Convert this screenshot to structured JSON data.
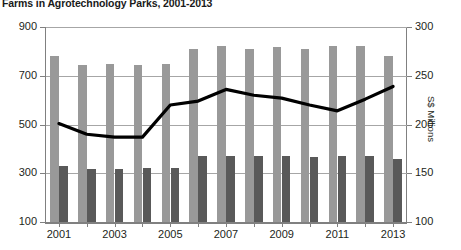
{
  "chart_data": {
    "type": "bar",
    "title": "Farms in Agrotechnology Parks, 2001-2013",
    "xlabel": "",
    "ylabel": "",
    "ylabel_right": "S$ Millions",
    "categories": [
      "2001",
      "2002",
      "2003",
      "2004",
      "2005",
      "2006",
      "2007",
      "2008",
      "2009",
      "2010",
      "2011",
      "2012",
      "2013"
    ],
    "xtick_labels": [
      "2001",
      "",
      "2003",
      "",
      "2005",
      "",
      "2007",
      "",
      "2009",
      "",
      "2011",
      "",
      "2013"
    ],
    "ylim": [
      100,
      900
    ],
    "yticks": [
      100,
      300,
      500,
      700,
      900
    ],
    "ylim_right": [
      100,
      300
    ],
    "yticks_right": [
      100,
      150,
      200,
      250,
      300
    ],
    "grid": true,
    "legend": "none",
    "series": [
      {
        "name": "Farms (light bar)",
        "type": "bar",
        "color": "#999999",
        "axis": "left",
        "values": [
          782,
          745,
          748,
          745,
          748,
          808,
          822,
          808,
          820,
          808,
          822,
          822,
          782
        ]
      },
      {
        "name": "Farms (dark bar)",
        "type": "bar",
        "color": "#595959",
        "axis": "left",
        "values": [
          330,
          318,
          318,
          322,
          322,
          372,
          372,
          372,
          372,
          368,
          372,
          372,
          358
        ]
      },
      {
        "name": "Output value",
        "type": "line",
        "color": "#000000",
        "axis": "right",
        "values": [
          201,
          190,
          187,
          187,
          220,
          224,
          236,
          230,
          227,
          220,
          214,
          226,
          239
        ]
      }
    ]
  }
}
